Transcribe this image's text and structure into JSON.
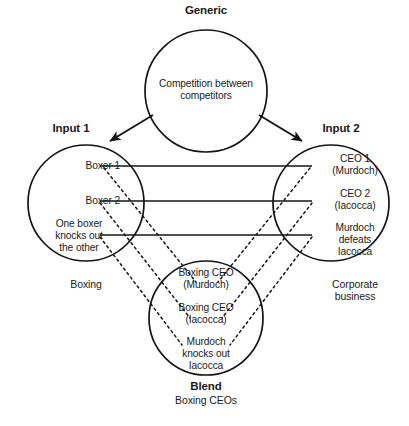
{
  "diagram": {
    "type": "conceptual-blending-network",
    "stroke_color": "#141414",
    "background": "#ffffff",
    "generic": {
      "title": "Generic",
      "content": "Competition between\ncompetitors",
      "cx": 206,
      "cy": 91,
      "r": 61
    },
    "input1": {
      "title": "Input 1",
      "domain_label": "Boxing",
      "elements": [
        {
          "text": "Boxer 1"
        },
        {
          "text": "Boxer 2"
        },
        {
          "text": "One boxer\nknocks out\nthe other"
        }
      ],
      "cx": 86,
      "cy": 203,
      "r": 58
    },
    "input2": {
      "title": "Input 2",
      "domain_label": "Corporate\nbusiness",
      "elements": [
        {
          "text": "CEO 1\n(Murdoch)"
        },
        {
          "text": "CEO 2\n(Iacocca)"
        },
        {
          "text": "Murdoch\ndefeats\nIacocca"
        }
      ],
      "cx": 331,
      "cy": 203,
      "r": 58
    },
    "blend": {
      "title": "Blend",
      "subtitle": "Boxing CEOs",
      "elements": [
        {
          "text": "Boxing CEO\n(Murdoch)"
        },
        {
          "text": "Boxing CEO\n(Iacocca)"
        },
        {
          "text": "Murdoch\nknocks out\nIacocca"
        }
      ],
      "cx": 206,
      "cy": 318,
      "r": 57
    },
    "generic_arrows": [
      {
        "name": "generic-to-input1",
        "x1": 153,
        "y1": 115,
        "x2": 110,
        "y2": 141
      },
      {
        "name": "generic-to-input2",
        "x1": 259,
        "y1": 115,
        "x2": 302,
        "y2": 141
      }
    ],
    "cross_space_links": [
      {
        "name": "boxer1-ceo1",
        "y": 166,
        "x1": 100,
        "x2": 312
      },
      {
        "name": "boxer2-ceo2",
        "y": 201,
        "x1": 100,
        "x2": 312
      },
      {
        "name": "knockout-defeat",
        "y": 235,
        "x1": 100,
        "x2": 312
      }
    ],
    "projections_left": [
      {
        "name": "boxer1-to-blend",
        "x1": 104,
        "y1": 168,
        "x2": 196,
        "y2": 282
      },
      {
        "name": "boxer2-to-blend",
        "x1": 100,
        "y1": 203,
        "x2": 190,
        "y2": 318
      },
      {
        "name": "knockout-to-blend",
        "x1": 100,
        "y1": 237,
        "x2": 182,
        "y2": 345
      }
    ],
    "projections_right": [
      {
        "name": "ceo1-to-blend",
        "x1": 310,
        "y1": 168,
        "x2": 218,
        "y2": 282
      },
      {
        "name": "ceo2-to-blend",
        "x1": 312,
        "y1": 203,
        "x2": 222,
        "y2": 318
      },
      {
        "name": "defeat-to-blend",
        "x1": 312,
        "y1": 237,
        "x2": 230,
        "y2": 345
      }
    ]
  }
}
